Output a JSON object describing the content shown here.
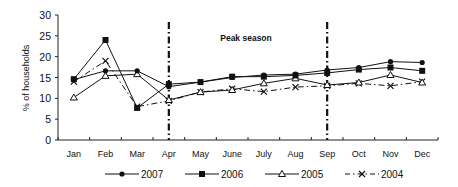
{
  "chart_data": {
    "type": "line",
    "title": "",
    "xlabel": "",
    "ylabel": "% of households",
    "ylim": [
      0,
      30
    ],
    "yticks": [
      0,
      5,
      10,
      15,
      20,
      25,
      30
    ],
    "grid": false,
    "legend_position": "bottom",
    "categories": [
      "Jan",
      "Feb",
      "Mar",
      "Apr",
      "May",
      "June",
      "July",
      "Aug",
      "Sep",
      "Oct",
      "Nov",
      "Dec"
    ],
    "annotations": [
      {
        "type": "vertical-line",
        "at": "Apr",
        "style": "dash-dot"
      },
      {
        "type": "vertical-line",
        "at": "Sep",
        "style": "dash-dot"
      },
      {
        "type": "text",
        "text": "Peak season",
        "between": [
          "Apr",
          "Sep"
        ]
      }
    ],
    "series": [
      {
        "name": "2007",
        "marker": "filled-circle",
        "line": "solid",
        "values": [
          14.5,
          16.6,
          16.6,
          12.8,
          13.9,
          15.0,
          15.6,
          15.8,
          16.8,
          17.4,
          18.8,
          18.6
        ]
      },
      {
        "name": "2006",
        "marker": "filled-square",
        "line": "solid",
        "values": [
          14.6,
          24.0,
          7.7,
          13.4,
          13.9,
          15.2,
          15.2,
          15.5,
          16.1,
          16.9,
          17.4,
          16.6
        ]
      },
      {
        "name": "2005",
        "marker": "open-triangle",
        "line": "solid",
        "values": [
          10.2,
          15.4,
          15.8,
          9.6,
          11.5,
          12.0,
          13.6,
          14.8,
          13.2,
          13.8,
          15.6,
          13.8
        ]
      },
      {
        "name": "2004",
        "marker": "x",
        "line": "dash-dot",
        "values": [
          14.0,
          19.0,
          8.0,
          9.4,
          11.5,
          12.3,
          11.6,
          12.7,
          13.0,
          13.6,
          13.0,
          14.0
        ]
      }
    ]
  },
  "labels": {
    "ylabel": "% of households",
    "peak": "Peak season"
  }
}
